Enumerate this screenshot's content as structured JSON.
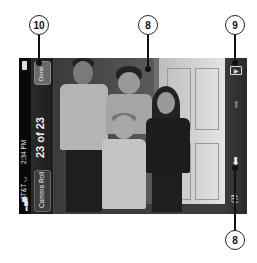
{
  "callouts": [
    {
      "number": "10",
      "target": "done-button"
    },
    {
      "number": "8",
      "target": "photo"
    },
    {
      "number": "9",
      "target": "slideshow-button"
    },
    {
      "number": "8",
      "target": "toolbar-action-button"
    }
  ],
  "status_bar": {
    "carrier": "AT&T",
    "time": "2:34 PM",
    "battery": "battery-icon"
  },
  "nav_bar": {
    "back_label": "Camera Roll",
    "title": "23 of 23",
    "done_label": "Done"
  },
  "toolbar": {
    "items": [
      "slideshow-icon",
      "up-arrow-icon",
      "down-arrow-icon",
      "trash-icon"
    ]
  },
  "photo": {
    "description": "Four children standing in front of a white door"
  }
}
